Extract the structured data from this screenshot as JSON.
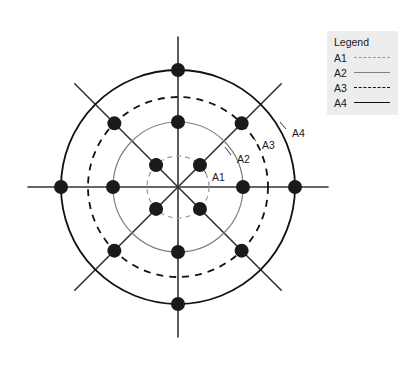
{
  "figure": {
    "type": "radial-network-diagram",
    "center": {
      "x": 178,
      "y": 187
    },
    "rays": {
      "count": 8,
      "angles_deg": [
        0,
        45,
        90,
        135,
        180,
        225,
        270,
        315
      ],
      "axis_extent_px": 150,
      "diagonal_extent_px": 146,
      "color": "#333333",
      "width_px": 1.6
    },
    "rings": [
      {
        "id": "A1",
        "label": "A1",
        "radius_px": 31,
        "style": "dashed",
        "color": "#9a9a9a",
        "width_px": 1.2,
        "dash": "5,4",
        "label_pos": {
          "x": 212,
          "y": 178
        },
        "leader": {
          "x1": 206,
          "y1": 173,
          "x2": 200,
          "y2": 166
        }
      },
      {
        "id": "A2",
        "label": "A2",
        "radius_px": 65,
        "style": "solid",
        "color": "#808080",
        "width_px": 1.2,
        "dash": "none",
        "label_pos": {
          "x": 237,
          "y": 160
        },
        "leader": {
          "x1": 231,
          "y1": 155,
          "x2": 225,
          "y2": 147
        }
      },
      {
        "id": "A3",
        "label": "A3",
        "radius_px": 90,
        "style": "dashed",
        "color": "#111111",
        "width_px": 1.8,
        "dash": "7,6",
        "label_pos": {
          "x": 262,
          "y": 146
        },
        "leader": {
          "x1": 256,
          "y1": 141,
          "x2": 250,
          "y2": 134
        }
      },
      {
        "id": "A4",
        "label": "A4",
        "radius_px": 117,
        "style": "solid",
        "color": "#111111",
        "width_px": 1.8,
        "dash": "none",
        "label_pos": {
          "x": 292,
          "y": 134
        },
        "leader": {
          "x1": 286,
          "y1": 129,
          "x2": 280,
          "y2": 122
        }
      }
    ],
    "nodes": {
      "fill": "#1a1a1a",
      "radius_px": 7,
      "groups": [
        {
          "ring": "A1",
          "radius_px": 31,
          "angles_deg": [
            45,
            135,
            225,
            315
          ]
        },
        {
          "ring": "A2",
          "radius_px": 65,
          "angles_deg": [
            0,
            90,
            180,
            270
          ]
        },
        {
          "ring": "A3",
          "radius_px": 90,
          "angles_deg": [
            45,
            135,
            225,
            315
          ]
        },
        {
          "ring": "A4",
          "radius_px": 117,
          "angles_deg": [
            0,
            90,
            180,
            270
          ]
        }
      ]
    }
  },
  "legend": {
    "title": "Legend",
    "background": "#ededed",
    "entries": [
      {
        "key": "A1",
        "style": "dashed",
        "color": "#9a9a9a",
        "width_px": 1.2
      },
      {
        "key": "A2",
        "style": "solid",
        "color": "#808080",
        "width_px": 1.2
      },
      {
        "key": "A3",
        "style": "dashed",
        "color": "#111111",
        "width_px": 1.8
      },
      {
        "key": "A4",
        "style": "solid",
        "color": "#111111",
        "width_px": 1.8
      }
    ],
    "position": {
      "x": 327,
      "y": 31,
      "width": 71,
      "height": 84
    }
  }
}
